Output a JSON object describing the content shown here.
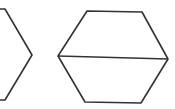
{
  "diagram": {
    "background": "#ffffff",
    "stroke_color": "#333333",
    "stroke_width": 1.6,
    "shapes": [
      {
        "name": "partial-hexagon-left",
        "points": "0,9 5,9 32,55 5,100 0,100"
      },
      {
        "name": "hexagon-right",
        "points": "87,11 142,12 168,59 141,103 85,102 58,56"
      }
    ],
    "lines": [
      {
        "name": "hexagon-diagonal",
        "x1": 58,
        "y1": 56,
        "x2": 168,
        "y2": 59
      }
    ]
  }
}
